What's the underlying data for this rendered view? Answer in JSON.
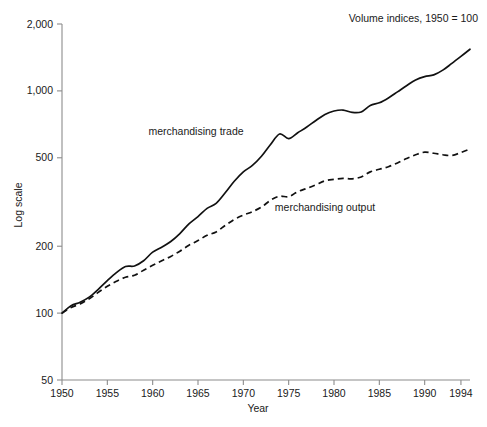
{
  "chart_data": {
    "type": "line",
    "title": "",
    "annotation": "Volume indices, 1950 = 100",
    "xlabel": "Year",
    "ylabel": "Log scale",
    "yscale": "log",
    "ylim": [
      50,
      2000
    ],
    "xlim": [
      1950,
      1995
    ],
    "grid": false,
    "legend_position": "inline-labels",
    "ytick_labels": [
      "2,000",
      "1,000",
      "500",
      "200",
      "100",
      "50"
    ],
    "ytick_values": [
      2000,
      1000,
      500,
      200,
      100,
      50
    ],
    "xtick_labels": [
      "1950",
      "1955",
      "1960",
      "1965",
      "1970",
      "1975",
      "1980",
      "1985",
      "1990",
      "1994"
    ],
    "xtick_values": [
      1950,
      1955,
      1960,
      1965,
      1970,
      1975,
      1980,
      1985,
      1990,
      1994
    ],
    "x": [
      1950,
      1951,
      1952,
      1953,
      1954,
      1955,
      1956,
      1957,
      1958,
      1959,
      1960,
      1961,
      1962,
      1963,
      1964,
      1965,
      1966,
      1967,
      1968,
      1969,
      1970,
      1971,
      1972,
      1973,
      1974,
      1975,
      1976,
      1977,
      1978,
      1979,
      1980,
      1981,
      1982,
      1983,
      1984,
      1985,
      1986,
      1987,
      1988,
      1989,
      1990,
      1991,
      1992,
      1993,
      1994,
      1995
    ],
    "series": [
      {
        "name": "merchandising trade",
        "style": "solid",
        "label": "merchandising trade",
        "values": [
          100,
          108,
          112,
          118,
          128,
          140,
          152,
          162,
          163,
          172,
          188,
          198,
          210,
          228,
          252,
          272,
          296,
          312,
          348,
          392,
          432,
          462,
          508,
          574,
          640,
          610,
          648,
          688,
          736,
          784,
          812,
          820,
          800,
          804,
          860,
          884,
          930,
          990,
          1055,
          1120,
          1160,
          1180,
          1240,
          1330,
          1430,
          1540
        ]
      },
      {
        "name": "merchandising output",
        "style": "dashed",
        "label": "merchandising output",
        "values": [
          100,
          106,
          110,
          116,
          124,
          132,
          139,
          145,
          148,
          156,
          164,
          172,
          180,
          190,
          202,
          212,
          224,
          232,
          248,
          264,
          276,
          286,
          300,
          322,
          336,
          334,
          352,
          364,
          378,
          394,
          400,
          404,
          402,
          410,
          432,
          444,
          456,
          474,
          496,
          516,
          530,
          524,
          516,
          512,
          528,
          548
        ]
      }
    ]
  },
  "axes": {
    "y_axis_label": "Log scale",
    "x_axis_label": "Year"
  },
  "annotations": {
    "units_note": "Volume indices, 1950 = 100",
    "trade_label": "merchandising trade",
    "output_label": "merchandising output"
  }
}
